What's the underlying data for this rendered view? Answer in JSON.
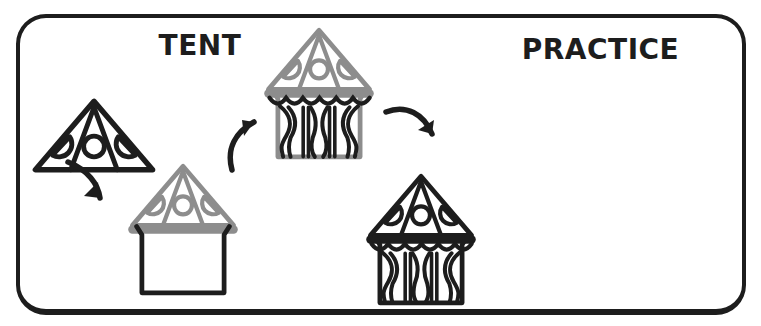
{
  "title": "TENT",
  "practice_label": "PRACTICE",
  "colors": {
    "ink": "#1d1d1d",
    "faded": "#8d8d8d",
    "background": "#ffffff",
    "frame_border": "#1d1d1d"
  },
  "steps": [
    {
      "id": 1,
      "parts": [
        {
          "part": "roof",
          "color": "ink"
        }
      ]
    },
    {
      "id": 2,
      "parts": [
        {
          "part": "roof",
          "color": "faded"
        },
        {
          "part": "band",
          "color": "faded"
        },
        {
          "part": "body",
          "color": "ink"
        }
      ]
    },
    {
      "id": 3,
      "parts": [
        {
          "part": "roof",
          "color": "faded"
        },
        {
          "part": "band",
          "color": "faded"
        },
        {
          "part": "body",
          "color": "faded"
        },
        {
          "part": "curtains",
          "color": "ink"
        }
      ]
    },
    {
      "id": 4,
      "parts": [
        {
          "part": "roof",
          "color": "ink"
        },
        {
          "part": "band",
          "color": "ink"
        },
        {
          "part": "body",
          "color": "ink"
        },
        {
          "part": "curtains",
          "color": "ink"
        }
      ]
    }
  ],
  "arrows": [
    {
      "direction": "down-right"
    },
    {
      "direction": "up-right"
    },
    {
      "direction": "down-right"
    }
  ]
}
